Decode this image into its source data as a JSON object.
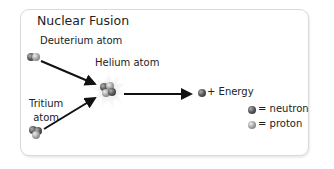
{
  "diagram": {
    "title": "Nuclear Fusion",
    "labels": {
      "deuterium": "Deuterium atom",
      "helium": "Helium atom",
      "tritium_line1": "Tritium",
      "tritium_line2": "atom",
      "energy": "+ Energy"
    },
    "legend": {
      "neutron": "= neutron",
      "proton": "= proton"
    },
    "colors": {
      "neutron": "#5a5a5a",
      "proton": "#a8a8a8",
      "arrow": "#111111",
      "burst": "#d8d8d8",
      "border": "#d9d9d9"
    }
  }
}
